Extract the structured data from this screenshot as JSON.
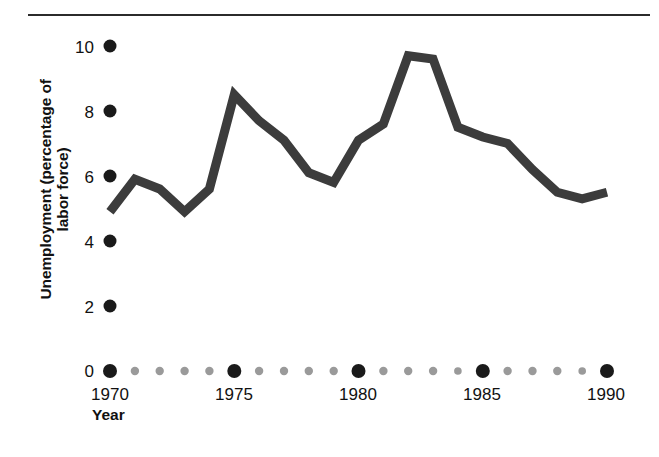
{
  "chart_data": {
    "type": "line",
    "title": "",
    "subtitle": "",
    "xlabel": "Year",
    "ylabel": "Unemployment (percentage of\nlabor force)",
    "ylabel_line1": "Unemployment (percentage of",
    "ylabel_line2": "labor force)",
    "xlim": [
      1970,
      1990
    ],
    "ylim": [
      0,
      10
    ],
    "grid": false,
    "legend": null,
    "y_ticks": [
      0,
      2,
      4,
      6,
      8,
      10
    ],
    "y_tick_labels": [
      "0",
      "2",
      "4",
      "6",
      "8",
      "10"
    ],
    "x_ticks": [
      1970,
      1975,
      1980,
      1985,
      1990
    ],
    "x_tick_labels": [
      "1970",
      "1975",
      "1980",
      "1985",
      "1990"
    ],
    "x_minor_ticks": [
      1971,
      1972,
      1973,
      1974,
      1976,
      1977,
      1978,
      1979,
      1981,
      1982,
      1983,
      1984,
      1986,
      1987,
      1988,
      1989
    ],
    "axis_style": "dotted-markers",
    "series": [
      {
        "name": "Unemployment rate",
        "color": "#3c3c3c",
        "line_width": 9,
        "x": [
          1970,
          1971,
          1972,
          1973,
          1974,
          1975,
          1976,
          1977,
          1978,
          1979,
          1980,
          1981,
          1982,
          1983,
          1984,
          1985,
          1986,
          1987,
          1988,
          1989,
          1990
        ],
        "values": [
          4.9,
          5.9,
          5.6,
          4.9,
          5.6,
          8.5,
          7.7,
          7.1,
          6.1,
          5.8,
          7.1,
          7.6,
          9.7,
          9.6,
          7.5,
          7.2,
          7.0,
          6.2,
          5.5,
          5.3,
          5.5
        ]
      }
    ]
  },
  "axis": {
    "y_title_line1": "Unemployment (percentage of",
    "y_title_line2": "labor force)",
    "x_title": "Year"
  },
  "colors": {
    "line": "#3c3c3c",
    "major_dot": "#1a1a1a",
    "minor_dot": "#9a9a9a",
    "text": "#111111",
    "rule": "#2b2b2b",
    "background": "#ffffff"
  }
}
